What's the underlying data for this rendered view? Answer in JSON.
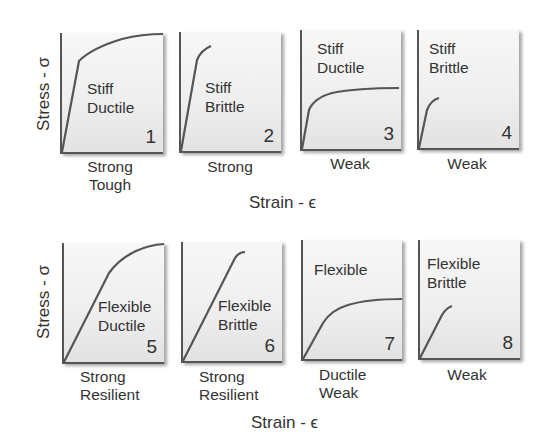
{
  "axes": {
    "row1": {
      "y_label": "Stress - σ",
      "x_label": "Strain - ϵ"
    },
    "row2": {
      "y_label": "Stress - σ",
      "x_label": "Strain - ϵ"
    }
  },
  "panels": [
    {
      "number": "1",
      "label_line1": "Stiff",
      "label_line2": "Ductile",
      "below_line1": "Strong",
      "below_line2": "Tough"
    },
    {
      "number": "2",
      "label_line1": "Stiff",
      "label_line2": "Brittle",
      "below_line1": "Strong",
      "below_line2": ""
    },
    {
      "number": "3",
      "label_line1": "Stiff",
      "label_line2": "Ductile",
      "below_line1": "Weak",
      "below_line2": ""
    },
    {
      "number": "4",
      "label_line1": "Stiff",
      "label_line2": "Brittle",
      "below_line1": "Weak",
      "below_line2": ""
    },
    {
      "number": "5",
      "label_line1": "Flexible",
      "label_line2": "Ductile",
      "below_line1": "Strong",
      "below_line2": "Resilient"
    },
    {
      "number": "6",
      "label_line1": "Flexible",
      "label_line2": "Brittle",
      "below_line1": "Strong",
      "below_line2": "Resilient"
    },
    {
      "number": "7",
      "label_line1": "Flexible",
      "label_line2": "",
      "below_line1": "Ductile",
      "below_line2": "Weak"
    },
    {
      "number": "8",
      "label_line1": "Flexible",
      "label_line2": "Brittle",
      "below_line1": "Weak",
      "below_line2": ""
    }
  ],
  "colors": {
    "curve": "#555555",
    "axis": "#555555",
    "panel_fill_top": "#f7f7f7",
    "panel_fill_bottom": "#e2e2e2"
  }
}
